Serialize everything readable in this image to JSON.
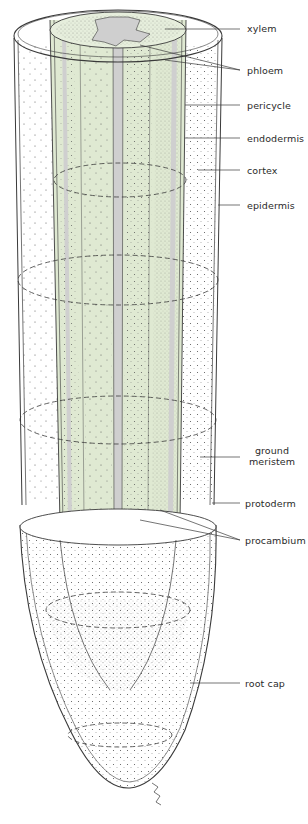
{
  "figure": {
    "colors": {
      "vascular_fill": "#dfe9d2",
      "xylem_gray": "#cfcfcf",
      "outline": "#3a3a3a",
      "stipple": "#555555"
    }
  },
  "labels": {
    "xylem": "xylem",
    "phloem": "phloem",
    "pericycle": "pericycle",
    "endodermis": "endodermis",
    "cortex": "cortex",
    "epidermis": "epidermis",
    "ground_meristem_1": "ground",
    "ground_meristem_2": "meristem",
    "protoderm": "protoderm",
    "procambium": "procambium",
    "root_cap": "root cap"
  }
}
